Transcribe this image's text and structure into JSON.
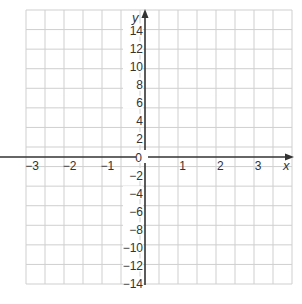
{
  "chart_data": {
    "type": "line",
    "title": "",
    "xlabel": "x",
    "ylabel": "y",
    "xlim": [
      -3,
      3
    ],
    "ylim": [
      -14,
      14
    ],
    "x_ticks": [
      -3,
      -2,
      -1,
      0,
      1,
      2,
      3
    ],
    "x_tick_labels": [
      "−3",
      "−2",
      "−1",
      "0",
      "1",
      "2",
      "3"
    ],
    "y_ticks": [
      14,
      12,
      10,
      8,
      6,
      4,
      2,
      -2,
      -4,
      -6,
      -8,
      -10,
      -12,
      -14
    ],
    "y_tick_labels": [
      "14",
      "12",
      "10",
      "8",
      "6",
      "4",
      "2",
      "−2",
      "−4",
      "−6",
      "−8",
      "−10",
      "−12",
      "−14"
    ],
    "grid": true,
    "grid_columns": 14,
    "grid_rows": 14,
    "series": [],
    "colors": {
      "grid": "#cfcfcf",
      "axis": "#333333",
      "text": "#333333",
      "background": "#ffffff"
    }
  }
}
